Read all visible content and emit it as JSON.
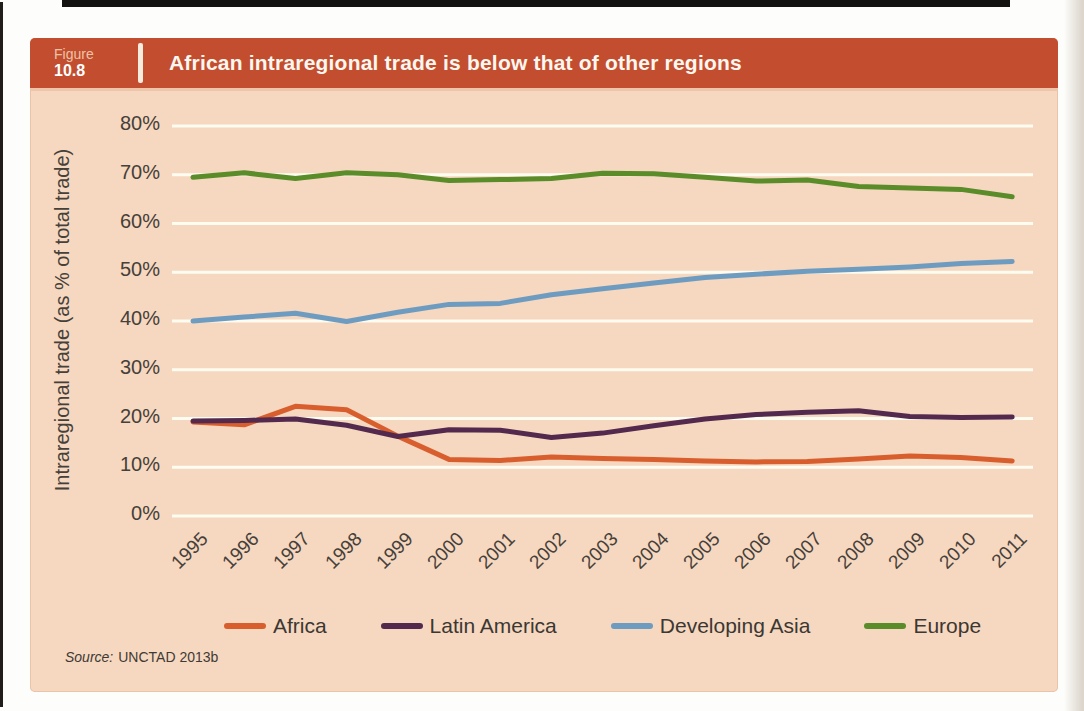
{
  "figure": {
    "label": "Figure",
    "number": "10.8",
    "title": "African intraregional trade is below that of other regions"
  },
  "source": {
    "prefix": "Source:",
    "text": "UNCTAD 2013b"
  },
  "colors": {
    "header_bar": "#c24e2f",
    "panel_background": "#f6d7bf",
    "gridline": "#fdfcf0",
    "axis_text": "#45403a",
    "africa": "#d85e2e",
    "latin_america": "#532a4e",
    "developing_asia": "#6e9cc0",
    "europe": "#5a8c29"
  },
  "chart_data": {
    "type": "line",
    "title": "African intraregional trade is below that of other regions",
    "xlabel": "",
    "ylabel": "Intraregional trade (as % of total trade)",
    "ylim": [
      0,
      80
    ],
    "yticks": [
      0,
      10,
      20,
      30,
      40,
      50,
      60,
      70,
      80
    ],
    "ytick_format": "percent",
    "grid": "horizontal",
    "legend_position": "bottom",
    "categories": [
      "1995",
      "1996",
      "1997",
      "1998",
      "1999",
      "2000",
      "2001",
      "2002",
      "2003",
      "2004",
      "2005",
      "2006",
      "2007",
      "2008",
      "2009",
      "2010",
      "2011"
    ],
    "series": [
      {
        "name": "Africa",
        "color": "#d85e2e",
        "values": [
          19.3,
          18.7,
          22.5,
          21.8,
          16.4,
          11.6,
          11.4,
          12.1,
          11.8,
          11.6,
          11.3,
          11.1,
          11.2,
          11.7,
          12.3,
          12.0,
          11.3
        ]
      },
      {
        "name": "Latin America",
        "color": "#532a4e",
        "values": [
          19.5,
          19.6,
          19.9,
          18.6,
          16.3,
          17.7,
          17.6,
          16.1,
          17.0,
          18.5,
          19.9,
          20.8,
          21.3,
          21.6,
          20.4,
          20.2,
          20.3
        ]
      },
      {
        "name": "Developing Asia",
        "color": "#6e9cc0",
        "values": [
          40.0,
          40.8,
          41.6,
          39.9,
          41.8,
          43.4,
          43.6,
          45.4,
          46.6,
          47.8,
          48.9,
          49.6,
          50.2,
          50.6,
          51.1,
          51.8,
          52.2
        ]
      },
      {
        "name": "Europe",
        "color": "#5a8c29",
        "values": [
          69.5,
          70.4,
          69.2,
          70.4,
          70.0,
          68.8,
          69.0,
          69.2,
          70.3,
          70.2,
          69.5,
          68.7,
          68.9,
          67.6,
          67.3,
          67.0,
          65.5
        ]
      }
    ]
  }
}
